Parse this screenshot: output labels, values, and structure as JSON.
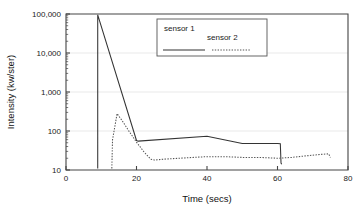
{
  "chart_data": {
    "type": "line",
    "title": "",
    "xlabel": "Time (secs)",
    "ylabel": "Intensity (kw/ster)",
    "xlim": [
      0,
      80
    ],
    "ylim": [
      10,
      100000
    ],
    "yscale": "log",
    "xscale": "linear",
    "grid": true,
    "grid_orientation": "horizontal",
    "legend_position": "top-center",
    "xticks": [
      0,
      20,
      40,
      60,
      80
    ],
    "xtick_labels": [
      "0",
      "20",
      "40",
      "60",
      "80"
    ],
    "yticks": [
      10,
      100,
      1000,
      10000,
      100000
    ],
    "ytick_labels": [
      "10",
      "100",
      "1,000",
      "10,000",
      "100,000"
    ],
    "series": [
      {
        "name": "sensor 1",
        "style": "solid",
        "color": "#333333",
        "x": [
          9,
          9,
          20,
          20.5,
          40,
          50,
          60,
          60.8,
          61,
          61.2
        ],
        "y": [
          11,
          95000,
          57,
          55,
          73,
          48,
          48,
          47,
          15,
          14
        ]
      },
      {
        "name": "sensor 2",
        "style": "dotted",
        "color": "#555555",
        "x": [
          13,
          13.2,
          14.5,
          16,
          18,
          20,
          22,
          24,
          25,
          28,
          32,
          36,
          40,
          45,
          50,
          55,
          60,
          64,
          68,
          72,
          74.5,
          75
        ],
        "y": [
          11,
          60,
          280,
          180,
          95,
          52,
          30,
          19,
          18,
          19,
          20,
          21,
          22,
          22,
          21,
          21,
          20,
          21,
          23,
          25,
          26,
          21
        ]
      }
    ]
  },
  "legend": {
    "entries": [
      {
        "label": "sensor 1"
      },
      {
        "label": "sensor 2"
      }
    ]
  },
  "axes": {
    "x_title": "Time (secs)",
    "y_title": "Intensity (kw/ster)"
  }
}
